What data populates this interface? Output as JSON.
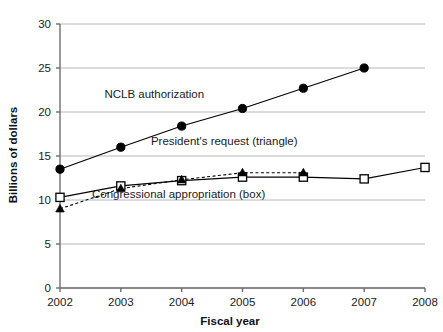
{
  "chart_data": {
    "type": "line",
    "title": "",
    "xlabel": "Fiscal year",
    "ylabel": "Billions of dollars",
    "x": [
      2002,
      2003,
      2004,
      2005,
      2006,
      2007,
      2008
    ],
    "xlim": [
      2002,
      2008
    ],
    "ylim": [
      0,
      30
    ],
    "yticks": [
      0,
      5,
      10,
      15,
      20,
      25,
      30
    ],
    "xticks": [
      "2002",
      "2003",
      "2004",
      "2005",
      "2006",
      "2007",
      "2008"
    ],
    "ytick_labels": [
      "0",
      "5",
      "10",
      "15",
      "20",
      "25",
      "30"
    ],
    "grid": "horizontal",
    "legend_position": "inline-annotations",
    "series": [
      {
        "name": "NCLB authorization",
        "marker": "filled-circle",
        "line_style": "solid",
        "color": "#000000",
        "x": [
          2002,
          2003,
          2004,
          2005,
          2006,
          2007
        ],
        "values": [
          13.5,
          16.0,
          18.4,
          20.4,
          22.7,
          25.0
        ]
      },
      {
        "name": "Congressional appropriation (box)",
        "marker": "open-square",
        "line_style": "solid",
        "color": "#000000",
        "x": [
          2002,
          2003,
          2004,
          2005,
          2006,
          2007,
          2008
        ],
        "values": [
          10.3,
          11.6,
          12.2,
          12.6,
          12.6,
          12.4,
          13.7
        ]
      },
      {
        "name": "President's request (triangle)",
        "marker": "filled-triangle",
        "line_style": "dashed",
        "color": "#000000",
        "x": [
          2002,
          2003,
          2004,
          2005,
          2006
        ],
        "values": [
          9.0,
          11.3,
          12.3,
          13.1,
          13.1
        ]
      }
    ],
    "annotations": [
      {
        "text": "NCLB authorization",
        "x": 2003.55,
        "y": 21.6
      },
      {
        "text": "President's request (triangle)",
        "x": 2004.7,
        "y": 16.2
      },
      {
        "text": "Congressional appropriation (box)",
        "x": 2003.95,
        "y": 10.2
      }
    ]
  },
  "colors": {
    "ink": "#000000",
    "grid": "#b8b8b8",
    "axis": "#6e6e6e",
    "text": "#1a1a1a"
  }
}
